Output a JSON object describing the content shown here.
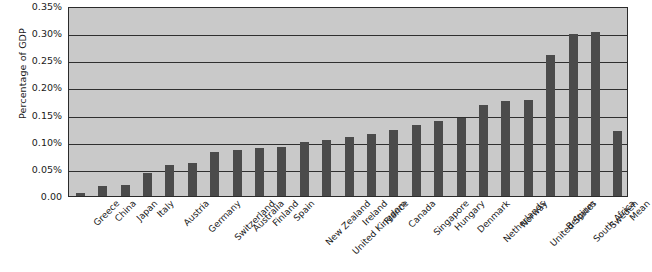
{
  "chart_data": {
    "type": "bar",
    "title": "",
    "subtitle": "",
    "xlabel": "",
    "ylabel": "Percentage of GDP",
    "ylim": [
      0,
      0.35
    ],
    "y_unit": "%",
    "grid": true,
    "grid_axis": "y",
    "legend": false,
    "legend_position": "none",
    "orientation": "vertical",
    "bar_color": "#4b4b4b",
    "plot_background": "#c9c9c9",
    "page_background": "#ffffff",
    "axis_color": "#2b2b2b",
    "gridline_color": "#2f2f2f",
    "y_ticks": [
      {
        "value": 0.0,
        "label": "0.00"
      },
      {
        "value": 0.05,
        "label": "0.05%"
      },
      {
        "value": 0.1,
        "label": "0.10%"
      },
      {
        "value": 0.15,
        "label": "0.15%"
      },
      {
        "value": 0.2,
        "label": "0.20%"
      },
      {
        "value": 0.25,
        "label": "0.25%"
      },
      {
        "value": 0.3,
        "label": "0.30%"
      },
      {
        "value": 0.35,
        "label": "0.35%"
      }
    ],
    "categories": [
      "Greece",
      "China",
      "Japan",
      "Italy",
      "Austria",
      "Germany",
      "Switzerland",
      "Australia",
      "Finland",
      "Spain",
      "New Zealand",
      "United Kingdom",
      "Ireland",
      "France",
      "Canada",
      "Singapore",
      "Hungary",
      "Denmark",
      "Netherlands",
      "Norway",
      "United States",
      "Belgium",
      "South Africa",
      "Sweden",
      "Mean"
    ],
    "values": [
      0.005,
      0.018,
      0.02,
      0.042,
      0.058,
      0.06,
      0.082,
      0.085,
      0.088,
      0.09,
      0.1,
      0.104,
      0.108,
      0.115,
      0.122,
      0.13,
      0.138,
      0.143,
      0.167,
      0.175,
      0.176,
      0.26,
      0.299,
      0.302,
      0.119
    ]
  }
}
